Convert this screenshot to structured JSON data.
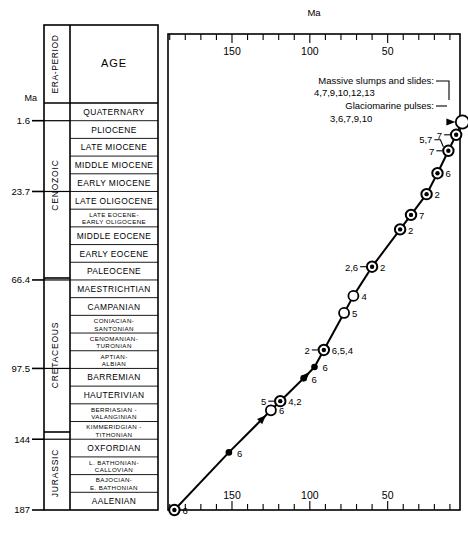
{
  "figure": {
    "axis_unit_top": "Ma",
    "axis_unit_left": "Ma",
    "column_header_era": "ERA-PERIOD",
    "column_header_age": "AGE"
  },
  "left_axis": {
    "ticks": [
      {
        "label": "1.6",
        "value": 1.6
      },
      {
        "label": "23.7",
        "value": 23.7
      },
      {
        "label": "66.4",
        "value": 66.4
      },
      {
        "label": "97.5",
        "value": 97.5
      },
      {
        "label": "144",
        "value": 144
      },
      {
        "label": "187",
        "value": 187
      }
    ]
  },
  "eras": [
    {
      "label": "CENOZOIC"
    },
    {
      "label": "CRETACEOUS"
    },
    {
      "label": "JURASSIC"
    }
  ],
  "age_rows": [
    {
      "label": "QUATERNARY"
    },
    {
      "label": "PLIOCENE"
    },
    {
      "label": "LATE MIOCENE"
    },
    {
      "label": "MIDDLE MIOCENE"
    },
    {
      "label": "EARLY MIOCENE"
    },
    {
      "label": "LATE OLIGOCENE"
    },
    {
      "label": "LATE EOCENE-\nEARLY OLIGOCENE"
    },
    {
      "label": "MIDDLE EOCENE"
    },
    {
      "label": "EARLY EOCENE"
    },
    {
      "label": "PALEOCENE"
    },
    {
      "label": "MAESTRICHTIAN"
    },
    {
      "label": "CAMPANIAN"
    },
    {
      "label": "CONIACIAN-\nSANTONIAN"
    },
    {
      "label": "CENOMANIAN-\nTURONIAN"
    },
    {
      "label": "APTIAN-\nALBIAN"
    },
    {
      "label": "BARREMIAN"
    },
    {
      "label": "HAUTERIVIAN"
    },
    {
      "label": "BERRIASIAN -\nVALANGINIAN"
    },
    {
      "label": "KIMMERIDGIAN -\nTITHONIAN"
    },
    {
      "label": "OXFORDIAN"
    },
    {
      "label": "L. BATHONIAN-\nCALLOVIAN"
    },
    {
      "label": "BAJOCIAN-\nE. BATHONIAN"
    },
    {
      "label": "AALENIAN"
    }
  ],
  "chart_data": {
    "type": "scatter",
    "title": "",
    "xlabel": "Ma",
    "ylabel": "Ma",
    "xlim": [
      187,
      0
    ],
    "ylim": [
      187,
      0
    ],
    "x_axis_reversed": true,
    "grid": false,
    "legend": "none",
    "xticks_labeled": [
      150,
      100,
      50
    ],
    "xticks_minor_step": 10,
    "annotations": [
      {
        "name": "massive-slumps",
        "text": "Massive slumps and slides:",
        "numbers": "4,7,9,10,12,13"
      },
      {
        "name": "glaciomarine-pulses",
        "text": "Glaciomarine pulses:",
        "numbers": "3,6,7,9,10"
      }
    ],
    "points": [
      {
        "id": "p1",
        "age": 187,
        "marker": "bullseye",
        "label_right": "6",
        "label_left": ""
      },
      {
        "id": "p2",
        "age": 152,
        "marker": "filled",
        "label_right": "6",
        "label_left": ""
      },
      {
        "id": "p3",
        "age": 125,
        "marker": "open",
        "label_right": "6",
        "label_left": ""
      },
      {
        "id": "p4",
        "age": 119,
        "marker": "bullseye",
        "label_right": "4,2",
        "label_left": "5"
      },
      {
        "id": "p5",
        "age": 104,
        "marker": "filled",
        "label_right": "6",
        "label_left": ""
      },
      {
        "id": "p6",
        "age": 97,
        "marker": "filled",
        "label_right": "6",
        "label_left": ""
      },
      {
        "id": "p7",
        "age": 91,
        "marker": "bullseye",
        "label_right": "6,5,4",
        "label_left": "2"
      },
      {
        "id": "p8",
        "age": 78,
        "marker": "open",
        "label_right": "5",
        "label_left": ""
      },
      {
        "id": "p9",
        "age": 72,
        "marker": "open",
        "label_right": "4",
        "label_left": ""
      },
      {
        "id": "p10",
        "age": 60,
        "marker": "bullseye",
        "label_right": "2",
        "label_left": "2,6"
      },
      {
        "id": "p11",
        "age": 42,
        "marker": "bullseye",
        "label_right": "2",
        "label_left": ""
      },
      {
        "id": "p12",
        "age": 35,
        "marker": "bullseye",
        "label_right": "7",
        "label_left": ""
      },
      {
        "id": "p13",
        "age": 25,
        "marker": "bullseye",
        "label_right": "2",
        "label_left": ""
      },
      {
        "id": "p14",
        "age": 18,
        "marker": "bullseye",
        "label_right": "6",
        "label_left": ""
      },
      {
        "id": "p15",
        "age": 11,
        "marker": "bullseye",
        "label_right": "",
        "label_left": "7",
        "label_left2": "5,7"
      },
      {
        "id": "p16",
        "age": 6,
        "marker": "bullseye",
        "label_right": "",
        "label_left": "7"
      },
      {
        "id": "p17",
        "age": 2,
        "marker": "open-large",
        "label_right": "",
        "label_left": ""
      }
    ]
  }
}
